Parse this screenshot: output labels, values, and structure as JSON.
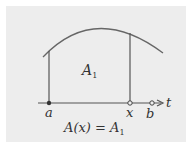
{
  "diagram": {
    "region_label": "A",
    "region_subscript": "1",
    "axis_variable": "t",
    "points": [
      {
        "label": "a",
        "type": "filled"
      },
      {
        "label": "x",
        "type": "open"
      },
      {
        "label": "b",
        "type": "open"
      }
    ],
    "equation": {
      "lhs": "A(x) = A",
      "subscript": "1"
    },
    "colors": {
      "background": "#ededed",
      "stroke": "#555555",
      "text": "#333333"
    }
  }
}
